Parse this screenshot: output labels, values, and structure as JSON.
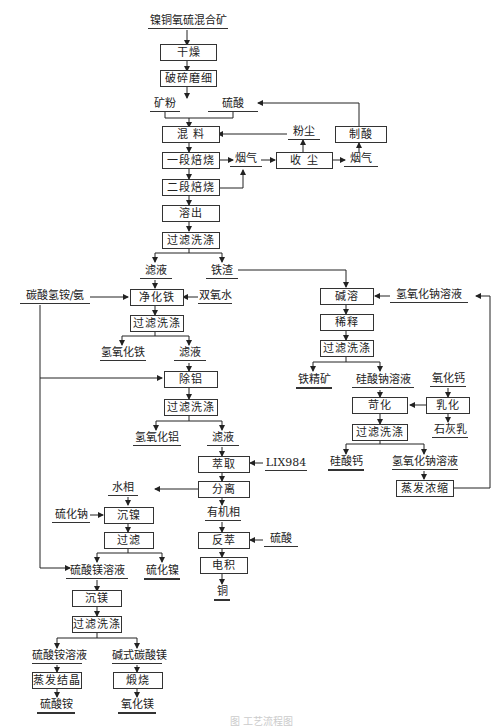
{
  "diagram": {
    "title": "镍铜氧硫混合矿",
    "caption": "图 工艺流程图",
    "process_boxes": {
      "dry": "干燥",
      "crush": "破碎磨细",
      "mix": "混 料",
      "roast1": "一段焙烧",
      "roast2": "二段焙烧",
      "leach": "溶出",
      "filter1": "过滤洗涤",
      "purify_fe": "净化铁",
      "filter2": "过滤洗涤",
      "remove_al": "除铝",
      "filter3": "过滤洗涤",
      "extract": "萃取",
      "separate": "分离",
      "ni_precip": "沉镍",
      "filter4": "过滤",
      "mg_precip": "沉镁",
      "filter5": "过滤洗涤",
      "evap_cryst": "蒸发结晶",
      "calcine": "煅烧",
      "strip": "反萃",
      "electrowin": "电积",
      "dust_collect": "收 尘",
      "acid_make": "制酸",
      "alkali_leach": "碱溶",
      "dilute": "稀释",
      "filter6": "过滤洗涤",
      "emulsify": "乳化",
      "causticize": "苛化",
      "filter7": "过滤洗涤",
      "evap_conc": "蒸发浓缩"
    },
    "labels": {
      "ore_powder": "矿粉",
      "sulfuric_acid": "硫酸",
      "dust": "粉尘",
      "flue_gas1": "烟气",
      "flue_gas2": "烟气",
      "filtrate1": "滤液",
      "iron_slag": "铁渣",
      "ammonium_bicarb": "碳酸氢铵/氨",
      "h2o2": "双氧水",
      "iron_hydroxide": "氢氧化铁",
      "filtrate2": "滤液",
      "al_hydroxide": "氢氧化铝",
      "filtrate3": "滤液",
      "lix984": "LIX984",
      "aqueous_phase": "水相",
      "organic_phase": "有机相",
      "sodium_sulfide": "硫化钠",
      "mgso4_solution": "硫酸镁溶液",
      "nickel_sulfide": "硫化镍",
      "sulfuric_acid2": "硫酸",
      "copper": "铜",
      "ammonium_sulfate_sol": "硫酸铵溶液",
      "basic_mg_carbonate": "碱式碳酸镁",
      "ammonium_sulfate": "硫酸铵",
      "magnesium_oxide": "氧化镁",
      "naoh_solution1": "氢氧化钠溶液",
      "iron_concentrate": "铁精矿",
      "sodium_silicate": "硅酸钠溶液",
      "calcium_oxide": "氧化钙",
      "lime_milk": "石灰乳",
      "calcium_silicate": "硅酸钙",
      "naoh_solution2": "氢氧化钠溶液"
    }
  }
}
